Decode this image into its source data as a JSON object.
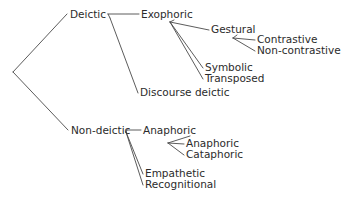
{
  "diagram": {
    "type": "tree",
    "orientation": "left-to-right",
    "canvas": {
      "width": 341,
      "height": 201
    },
    "style": {
      "line_color": "#4a4a4a",
      "text_color": "#2b2b2b",
      "background_color": "#ffffff",
      "font_size_px": 10.5,
      "line_width_px": 0.9
    },
    "root_vertex": {
      "x": 13,
      "y": 72
    },
    "nodes": [
      {
        "id": "deictic",
        "label": "Deictic",
        "level": 1,
        "x": 70,
        "y": 18,
        "anchor": "start",
        "parent": null
      },
      {
        "id": "exophoric",
        "label": "Exophoric",
        "level": 2,
        "x": 141,
        "y": 18,
        "anchor": "start",
        "parent": "deictic"
      },
      {
        "id": "gestural",
        "label": "Gestural",
        "level": 3,
        "x": 211,
        "y": 33,
        "anchor": "start",
        "parent": "exophoric"
      },
      {
        "id": "contrastive",
        "label": "Contrastive",
        "level": 4,
        "x": 257,
        "y": 43,
        "anchor": "start",
        "parent": "gestural"
      },
      {
        "id": "non-contrastive",
        "label": "Non-contrastive",
        "level": 4,
        "x": 257,
        "y": 54,
        "anchor": "start",
        "parent": "gestural"
      },
      {
        "id": "symbolic",
        "label": "Symbolic",
        "level": 3,
        "x": 205,
        "y": 71,
        "anchor": "start",
        "parent": "exophoric"
      },
      {
        "id": "transposed",
        "label": "Transposed",
        "level": 3,
        "x": 205,
        "y": 82,
        "anchor": "start",
        "parent": "exophoric"
      },
      {
        "id": "discourse-deictic",
        "label": "Discourse deictic",
        "level": 2,
        "x": 140,
        "y": 96,
        "anchor": "start",
        "parent": "deictic"
      },
      {
        "id": "non-deictic",
        "label": "Non-deictic",
        "level": 1,
        "x": 71,
        "y": 134,
        "anchor": "start",
        "parent": null
      },
      {
        "id": "anaphoric-parent",
        "label": "Anaphoric",
        "level": 2,
        "x": 143,
        "y": 134,
        "anchor": "start",
        "parent": "non-deictic"
      },
      {
        "id": "anaphoric-child",
        "label": "Anaphoric",
        "level": 3,
        "x": 186,
        "y": 147,
        "anchor": "start",
        "parent": "anaphoric-parent"
      },
      {
        "id": "cataphoric",
        "label": "Cataphoric",
        "level": 3,
        "x": 186,
        "y": 158,
        "anchor": "start",
        "parent": "anaphoric-parent"
      },
      {
        "id": "empathetic",
        "label": "Empathetic",
        "level": 2,
        "x": 145,
        "y": 177,
        "anchor": "start",
        "parent": "non-deictic"
      },
      {
        "id": "recognitional",
        "label": "Recognitional",
        "level": 2,
        "x": 145,
        "y": 188,
        "anchor": "start",
        "parent": "non-deictic"
      }
    ],
    "edges": [
      {
        "id": "edge-root-deictic",
        "from": "root-vertex",
        "to": "deictic",
        "points": "13,72 67,14"
      },
      {
        "id": "edge-root-non-deictic",
        "from": "root-vertex",
        "to": "non-deictic",
        "points": "13,72 68,130"
      },
      {
        "id": "edge-deictic-exophoric",
        "from": "deictic",
        "to": "exophoric",
        "points": "108,14 139,14"
      },
      {
        "id": "edge-deictic-branch",
        "from": "deictic",
        "to": "deictic-vertex",
        "points": "108,14 110,18"
      },
      {
        "id": "edge-deictic-discourse",
        "from": "deictic",
        "to": "discourse-deictic",
        "points": "110,18 138,93"
      },
      {
        "id": "edge-exophoric-branch",
        "from": "exophoric",
        "to": "exophoric-vertex",
        "points": "174,20 170,22"
      },
      {
        "id": "edge-exophoric-gestural",
        "from": "exophoric-vertex",
        "to": "gestural",
        "points": "170,22 209,30"
      },
      {
        "id": "edge-exophoric-symbolic",
        "from": "exophoric-vertex",
        "to": "symbolic",
        "points": "170,22 203,68"
      },
      {
        "id": "edge-exophoric-transposed",
        "from": "exophoric-vertex",
        "to": "transposed",
        "points": "170,22 203,79"
      },
      {
        "id": "edge-gestural-branch",
        "from": "gestural",
        "to": "gestural-vertex",
        "points": "237,35 233,38"
      },
      {
        "id": "edge-gestural-contrastive",
        "from": "gestural-vertex",
        "to": "contrastive",
        "points": "233,38 255,40"
      },
      {
        "id": "edge-gestural-noncontrastive",
        "from": "gestural-vertex",
        "to": "non-contrastive",
        "points": "233,38 255,51"
      },
      {
        "id": "edge-nondeictic-anaphoric",
        "from": "non-deictic",
        "to": "anaphoric-parent",
        "points": "127,130 141,130"
      },
      {
        "id": "edge-nondeictic-branch",
        "from": "non-deictic",
        "to": "nondeictic-vertex",
        "points": "127,130 126,132"
      },
      {
        "id": "edge-nondeictic-empathetic",
        "from": "nondeictic-vertex",
        "to": "empathetic",
        "points": "126,132 143,174"
      },
      {
        "id": "edge-nondeictic-recognitional",
        "from": "nondeictic-vertex",
        "to": "recognitional",
        "points": "126,132 143,185"
      },
      {
        "id": "edge-anaphoric-branch",
        "from": "anaphoric-parent",
        "to": "anaphoric-vertex",
        "points": "190,136 168,143"
      },
      {
        "id": "edge-anaphoric-child",
        "from": "anaphoric-vertex",
        "to": "anaphoric-child",
        "points": "168,143 184,144"
      },
      {
        "id": "edge-anaphoric-cataphoric",
        "from": "anaphoric-vertex",
        "to": "cataphoric",
        "points": "168,143 184,155"
      }
    ]
  }
}
